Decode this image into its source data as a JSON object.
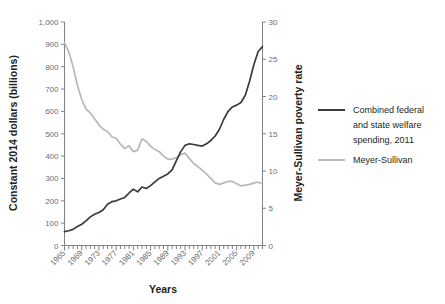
{
  "chart_data": {
    "type": "line",
    "title": "",
    "xlabel": "Years",
    "ylabel": "Constant 2014 dollars (billions)",
    "y2label": "Meyer-Sullivan poverty rate",
    "grid": false,
    "legend_position": "right",
    "xlim": [
      1965,
      2011
    ],
    "ylim": [
      0,
      1000
    ],
    "y2lim": [
      0,
      30
    ],
    "ytick_labels": [
      "0",
      "100",
      "200",
      "300",
      "400",
      "500",
      "600",
      "700",
      "800",
      "900",
      "1,000"
    ],
    "yticks": [
      0,
      100,
      200,
      300,
      400,
      500,
      600,
      700,
      800,
      900,
      1000
    ],
    "y2tick_labels": [
      "0",
      "5",
      "10",
      "15",
      "20",
      "25",
      "30"
    ],
    "y2ticks": [
      0,
      5,
      10,
      15,
      20,
      25,
      30
    ],
    "xtick_labels": [
      "1965",
      "1969",
      "1973",
      "1977",
      "1981",
      "1985",
      "1989",
      "1993",
      "1997",
      "2001",
      "2005",
      "2009"
    ],
    "xticks": [
      1965,
      1969,
      1973,
      1977,
      1981,
      1985,
      1989,
      1993,
      1997,
      2001,
      2005,
      2009
    ],
    "x": [
      1965,
      1966,
      1967,
      1968,
      1969,
      1970,
      1971,
      1972,
      1973,
      1974,
      1975,
      1976,
      1977,
      1978,
      1979,
      1980,
      1981,
      1982,
      1983,
      1984,
      1985,
      1986,
      1987,
      1988,
      1989,
      1990,
      1991,
      1992,
      1993,
      1994,
      1995,
      1996,
      1997,
      1998,
      1999,
      2000,
      2001,
      2002,
      2003,
      2004,
      2005,
      2006,
      2007,
      2008,
      2009,
      2010,
      2011
    ],
    "series": [
      {
        "name": "Combined federal and state welfare spending, 2011",
        "axis": "left",
        "color": "#3b3b3d",
        "unit": "Constant 2014 dollars (billions)",
        "values": [
          62,
          66,
          72,
          85,
          95,
          110,
          128,
          140,
          148,
          160,
          185,
          196,
          200,
          208,
          215,
          235,
          252,
          240,
          262,
          255,
          268,
          285,
          300,
          310,
          320,
          338,
          380,
          420,
          448,
          455,
          452,
          448,
          445,
          455,
          470,
          490,
          520,
          565,
          600,
          620,
          628,
          640,
          672,
          735,
          810,
          868,
          890
        ]
      },
      {
        "name": "Meyer-Sullivan",
        "axis": "right",
        "color": "#b7b8ba",
        "unit": "Meyer-Sullivan poverty rate",
        "values": [
          27.2,
          26.0,
          24.0,
          21.5,
          19.6,
          18.3,
          17.8,
          17.0,
          16.2,
          15.6,
          15.3,
          14.6,
          14.4,
          13.6,
          13.0,
          13.4,
          12.6,
          12.8,
          14.3,
          14.0,
          13.3,
          12.9,
          12.6,
          12.0,
          11.6,
          11.6,
          11.8,
          12.2,
          12.4,
          11.7,
          11.0,
          10.6,
          10.1,
          9.6,
          9.0,
          8.4,
          8.2,
          8.4,
          8.6,
          8.6,
          8.3,
          8.0,
          8.1,
          8.2,
          8.4,
          8.5,
          8.3
        ]
      }
    ]
  },
  "legend": {
    "items": [
      {
        "label_lines": [
          "Combined federal",
          "and state welfare",
          "spending, 2011"
        ],
        "color": "#3b3b3d"
      },
      {
        "label_lines": [
          "Meyer-Sullivan"
        ],
        "color": "#b7b8ba"
      }
    ]
  },
  "colors": {
    "dark_series": "#3b3b3d",
    "light_series": "#b7b8ba",
    "axis": "#808285",
    "text": "#231f20",
    "tick_text": "#6d6e71",
    "background": "#ffffff"
  }
}
